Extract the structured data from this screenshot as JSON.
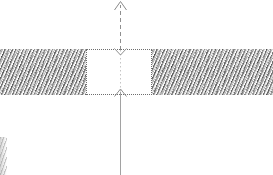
{
  "figure": {
    "background_color": "#ffffff",
    "width": 273,
    "height": 175
  },
  "regions": [
    {
      "name": "left-hatched-block",
      "label": "",
      "fill": "hatched-gray-texture",
      "color": "#b9b9b9",
      "x": 0,
      "y": 49,
      "width": 86,
      "height": 46
    },
    {
      "name": "right-hatched-block",
      "label": "",
      "fill": "hatched-gray-texture",
      "color": "#b9b9b9",
      "x": 152,
      "y": 49,
      "width": 121,
      "height": 46
    },
    {
      "name": "center-gap-box",
      "label": "",
      "fill": "white",
      "border_style": "dotted",
      "border_color": "#6e6e6e",
      "x": 86,
      "y": 49,
      "width": 66,
      "height": 46
    }
  ],
  "annotations": {
    "upper_axis": {
      "name": "upper-dashed-axis",
      "style": "dashed",
      "color": "#8a8a8a",
      "x": 120,
      "from_y": 50,
      "to_y": 4,
      "arrowhead": "up"
    },
    "lower_axis": {
      "name": "lower-solid-axis",
      "style": "solid",
      "color": "#9a9a9a",
      "x": 120,
      "from_y": 93,
      "to_y": 175,
      "arrowhead": "up"
    },
    "inner_axis": {
      "name": "inner-dotted-centerline",
      "style": "dotted",
      "color": "#bdbdbd",
      "x": 120,
      "from_y": 50,
      "to_y": 93
    },
    "top_box_arrow": {
      "name": "gap-top-arrowhead",
      "direction": "down",
      "x": 120,
      "y": 50,
      "color": "#888888"
    },
    "bottom_box_arrow": {
      "name": "gap-bottom-arrowhead",
      "direction": "up",
      "x": 120,
      "y": 93,
      "color": "#888888"
    }
  },
  "artifacts": [
    {
      "name": "bottom-left-edge-smudge",
      "x": 0,
      "y": 137,
      "width": 7,
      "height": 38
    }
  ],
  "labels": {
    "none": ""
  }
}
